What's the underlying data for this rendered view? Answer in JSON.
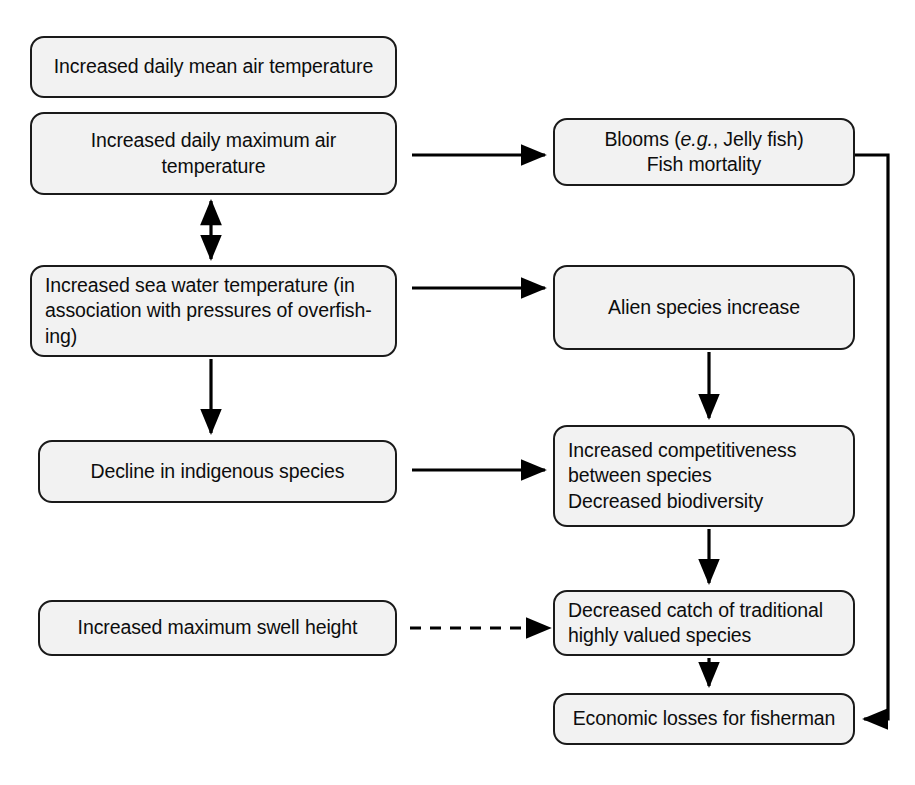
{
  "diagram": {
    "background_color": "#ffffff",
    "node_fill_color": "#f2f2f2",
    "node_border_color": "#1a1a1a",
    "edge_color": "#000000",
    "nodes": [
      {
        "id": "daily-mean-air-temp",
        "label": "Increased daily mean air temperature",
        "align": "center",
        "x": 30,
        "y": 36,
        "w": 367,
        "h": 62
      },
      {
        "id": "daily-max-air-temp",
        "label": "Increased daily maximum air\ntemperature",
        "align": "center",
        "x": 30,
        "y": 112,
        "w": 367,
        "h": 83
      },
      {
        "id": "blooms-fish-mortality",
        "label": "Blooms (e.g., Jelly fish)\nFish mortality",
        "label_html": "Blooms (<em>e.g.</em>, Jelly fish)<br>Fish mortality",
        "align": "center",
        "x": 553,
        "y": 118,
        "w": 302,
        "h": 68
      },
      {
        "id": "sea-water-temp",
        "label": "Increased sea water temperature (in\nassociation with pressures of overfish-\ning)",
        "align": "left",
        "x": 30,
        "y": 265,
        "w": 367,
        "h": 92
      },
      {
        "id": "alien-species-increase",
        "label": "Alien species increase",
        "align": "center",
        "x": 553,
        "y": 265,
        "w": 302,
        "h": 85
      },
      {
        "id": "decline-indigenous-species",
        "label": "Decline in indigenous species",
        "align": "center",
        "x": 38,
        "y": 440,
        "w": 359,
        "h": 63
      },
      {
        "id": "increased-competitiveness",
        "label": "Increased competitiveness\nbetween species\nDecreased biodiversity",
        "align": "left",
        "x": 553,
        "y": 425,
        "w": 302,
        "h": 102
      },
      {
        "id": "max-swell-height",
        "label": "Increased maximum swell height",
        "align": "center",
        "x": 38,
        "y": 600,
        "w": 359,
        "h": 56
      },
      {
        "id": "decreased-catch",
        "label": "Decreased catch of traditional\nhighly valued species",
        "align": "left",
        "x": 553,
        "y": 590,
        "w": 302,
        "h": 66
      },
      {
        "id": "economic-losses",
        "label": "Economic losses for fisherman",
        "align": "center",
        "x": 553,
        "y": 693,
        "w": 302,
        "h": 52
      }
    ],
    "edges": [
      {
        "id": "edge-daily-max-to-blooms",
        "from": "daily-max-air-temp",
        "to": "blooms-fish-mortality",
        "style": "solid",
        "arrow": "single",
        "direction": "horizontal"
      },
      {
        "id": "edge-daily-max-seawater-bidirection",
        "from": "daily-max-air-temp",
        "to": "sea-water-temp",
        "style": "solid",
        "arrow": "double",
        "direction": "vertical"
      },
      {
        "id": "edge-seawater-to-alien",
        "from": "sea-water-temp",
        "to": "alien-species-increase",
        "style": "solid",
        "arrow": "single",
        "direction": "horizontal"
      },
      {
        "id": "edge-seawater-to-decline",
        "from": "sea-water-temp",
        "to": "decline-indigenous-species",
        "style": "solid",
        "arrow": "single",
        "direction": "vertical"
      },
      {
        "id": "edge-alien-to-competitiveness",
        "from": "alien-species-increase",
        "to": "increased-competitiveness",
        "style": "solid",
        "arrow": "single",
        "direction": "vertical"
      },
      {
        "id": "edge-decline-to-competitiveness",
        "from": "decline-indigenous-species",
        "to": "increased-competitiveness",
        "style": "solid",
        "arrow": "single",
        "direction": "horizontal"
      },
      {
        "id": "edge-competitiveness-to-catch",
        "from": "increased-competitiveness",
        "to": "decreased-catch",
        "style": "solid",
        "arrow": "single",
        "direction": "vertical"
      },
      {
        "id": "edge-swell-to-catch",
        "from": "max-swell-height",
        "to": "decreased-catch",
        "style": "dashed",
        "arrow": "single",
        "direction": "horizontal"
      },
      {
        "id": "edge-catch-to-economic-losses",
        "from": "decreased-catch",
        "to": "economic-losses",
        "style": "solid",
        "arrow": "single",
        "direction": "vertical"
      },
      {
        "id": "edge-blooms-to-economic-losses",
        "from": "blooms-fish-mortality",
        "to": "economic-losses",
        "style": "solid",
        "arrow": "single",
        "direction": "routed-right"
      }
    ]
  }
}
